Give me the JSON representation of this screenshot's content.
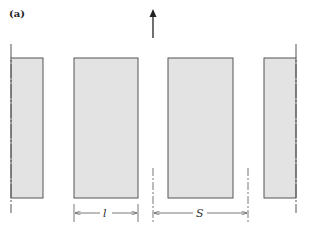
{
  "figure": {
    "panel_label": "(a)",
    "flow_direction": "up",
    "colors": {
      "blade_fill": "#e3e3e3",
      "blade_stroke": "#555555",
      "line": "#555555",
      "arrow": "#222222"
    },
    "blades": [
      {
        "name": "blade-partial-left",
        "x": 11,
        "y": 58,
        "w": 32,
        "h": 140
      },
      {
        "name": "blade-left",
        "x": 74,
        "y": 58,
        "w": 64,
        "h": 140
      },
      {
        "name": "blade-right",
        "x": 168,
        "y": 58,
        "w": 65,
        "h": 140
      },
      {
        "name": "blade-partial-right",
        "x": 264,
        "y": 58,
        "w": 32,
        "h": 140
      }
    ],
    "dimensions": {
      "chord": {
        "label": "l",
        "x1": 74,
        "x2": 138,
        "y": 213
      },
      "spacing": {
        "label": "S",
        "x1": 153,
        "x2": 248,
        "y": 213
      }
    }
  }
}
